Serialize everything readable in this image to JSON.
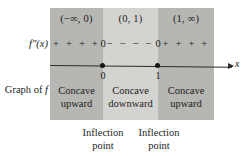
{
  "chart_data": {
    "type": "table",
    "title": "",
    "variable_label": "x",
    "row_labels": [
      "f″(x)",
      "Graph of f"
    ],
    "intervals": [
      {
        "notation": "(−∞, 0)",
        "sign_marks": "+  +  +  +",
        "sign": "positive",
        "concavity_line1": "Concave",
        "concavity_line2": "upward"
      },
      {
        "notation": "(0, 1)",
        "sign_marks": "−  −  −  −",
        "sign": "negative",
        "concavity_line1": "Concave",
        "concavity_line2": "downward"
      },
      {
        "notation": "(1, ∞)",
        "sign_marks": "+  +  +  +",
        "sign": "positive",
        "concavity_line1": "Concave",
        "concavity_line2": "upward"
      }
    ],
    "critical_points": [
      {
        "tick": "0",
        "second_derivative_value": "0",
        "caption_line1": "Inflection",
        "caption_line2": "point"
      },
      {
        "tick": "1",
        "second_derivative_value": "0",
        "caption_line1": "Inflection",
        "caption_line2": "point"
      }
    ],
    "colors": {
      "panel_positive": "#b6b6b2",
      "panel_negative": "#d3d3cf",
      "axis": "#2b2b2b",
      "text": "#1c1c1c",
      "background": "#ffffff"
    }
  }
}
